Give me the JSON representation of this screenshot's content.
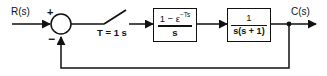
{
  "diagram": {
    "line_color": "#111111",
    "background": "#ffffff",
    "input_label": "R(s)",
    "output_label": "C(s)",
    "summing_junction": {
      "positive_sign": "+",
      "negative_sign": "−"
    },
    "sampler": {
      "label": "T = 1 s",
      "period_value": "1",
      "period_unit": "s"
    },
    "blocks": [
      {
        "name": "zero-order-hold",
        "numerator": "1 − ε",
        "numerator_exponent": "−Ts",
        "denominator": "s",
        "expression": "(1 − ε^(−Ts))/s"
      },
      {
        "name": "plant",
        "numerator": "1",
        "denominator": "s(s + 1)",
        "expression": "1/(s(s + 1))"
      }
    ],
    "feedback": {
      "type": "unity",
      "direction": "negative"
    }
  }
}
